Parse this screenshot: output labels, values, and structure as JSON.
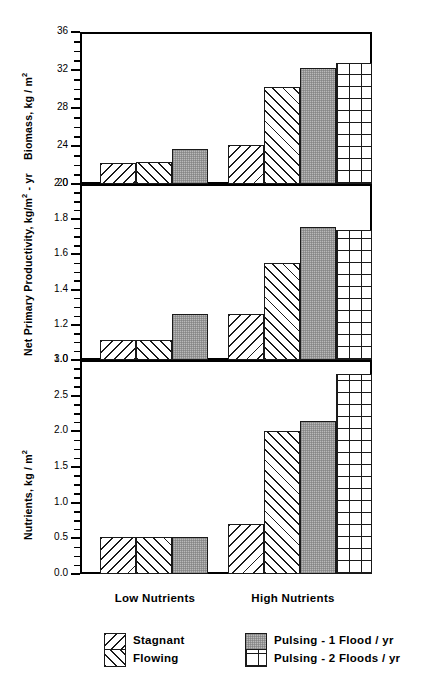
{
  "chart_data": {
    "type": "bar",
    "title": "",
    "layout": "three stacked panels sharing a common categorical x-axis",
    "categories": [
      "Low Nutrients",
      "High Nutrients"
    ],
    "legend_position": "below axis, two columns",
    "series": [
      {
        "name": "Stagnant",
        "pattern": "backslash-hatch",
        "values_by_panel": {
          "biomass": [
            22.2,
            24.1
          ],
          "npp": [
            1.115,
            1.26
          ],
          "nutrients": [
            0.52,
            0.7
          ]
        }
      },
      {
        "name": "Flowing",
        "pattern": "forwardslash-hatch",
        "values_by_panel": {
          "biomass": [
            22.3,
            30.2
          ],
          "npp": [
            1.115,
            1.55
          ],
          "nutrients": [
            0.52,
            2.0
          ]
        }
      },
      {
        "name": "Pulsing - 1 Flood / yr",
        "pattern": "gray-solid",
        "values_by_panel": {
          "biomass": [
            23.7,
            32.2
          ],
          "npp": [
            1.26,
            1.755
          ],
          "nutrients": [
            0.52,
            2.15
          ]
        }
      },
      {
        "name": "Pulsing - 2 Floods / yr",
        "pattern": "grid-crosshatch",
        "values_by_panel": {
          "biomass": [
            null,
            32.7
          ],
          "npp": [
            null,
            1.74
          ],
          "nutrients": [
            null,
            2.8
          ]
        }
      }
    ],
    "panels": [
      {
        "id": "biomass",
        "ylabel": "Biomass, kg / m",
        "ylabel_sup": "2",
        "ylim": [
          20,
          36
        ],
        "ytick_labels": [
          "20",
          "24",
          "28",
          "32",
          "36"
        ],
        "ytick_values": [
          20,
          24,
          28,
          32,
          36
        ],
        "minor_tick_step": 1,
        "grid": false,
        "bars": [
          {
            "group": "Low Nutrients",
            "series": "Stagnant",
            "value": 22.2
          },
          {
            "group": "Low Nutrients",
            "series": "Flowing",
            "value": 22.3
          },
          {
            "group": "Low Nutrients",
            "series": "Pulsing - 1 Flood / yr",
            "value": 23.7
          },
          {
            "group": "High Nutrients",
            "series": "Stagnant",
            "value": 24.1
          },
          {
            "group": "High Nutrients",
            "series": "Flowing",
            "value": 30.2
          },
          {
            "group": "High Nutrients",
            "series": "Pulsing - 1 Flood / yr",
            "value": 32.2
          },
          {
            "group": "High Nutrients",
            "series": "Pulsing - 2 Floods / yr",
            "value": 32.7
          }
        ]
      },
      {
        "id": "npp",
        "ylabel": "Net Primary Productivity, kg/m",
        "ylabel_sup": "2",
        "ylabel_tail": "- yr",
        "ylim": [
          1.0,
          2.0
        ],
        "ytick_labels": [
          "1.0",
          "1.2",
          "1.4",
          "1.6",
          "1.8",
          "2.0"
        ],
        "ytick_values": [
          1.0,
          1.2,
          1.4,
          1.6,
          1.8,
          2.0
        ],
        "minor_tick_step": 0.05,
        "grid": false,
        "bars": [
          {
            "group": "Low Nutrients",
            "series": "Stagnant",
            "value": 1.115
          },
          {
            "group": "Low Nutrients",
            "series": "Flowing",
            "value": 1.115
          },
          {
            "group": "Low Nutrients",
            "series": "Pulsing - 1 Flood / yr",
            "value": 1.26
          },
          {
            "group": "High Nutrients",
            "series": "Stagnant",
            "value": 1.26
          },
          {
            "group": "High Nutrients",
            "series": "Flowing",
            "value": 1.55
          },
          {
            "group": "High Nutrients",
            "series": "Pulsing - 1 Flood / yr",
            "value": 1.755
          },
          {
            "group": "High Nutrients",
            "series": "Pulsing - 2 Floods / yr",
            "value": 1.74
          }
        ]
      },
      {
        "id": "nutrients",
        "ylabel": "Nutrients, kg / m",
        "ylabel_sup": "2",
        "ylim": [
          0.0,
          3.0
        ],
        "ytick_labels": [
          "0.0",
          "0.5",
          "1.0",
          "1.5",
          "2.0",
          "2.5",
          "3.0"
        ],
        "ytick_values": [
          0.0,
          0.5,
          1.0,
          1.5,
          2.0,
          2.5,
          3.0
        ],
        "minor_tick_step": 0.125,
        "grid": false,
        "bars": [
          {
            "group": "Low Nutrients",
            "series": "Stagnant",
            "value": 0.52
          },
          {
            "group": "Low Nutrients",
            "series": "Flowing",
            "value": 0.52
          },
          {
            "group": "Low Nutrients",
            "series": "Pulsing - 1 Flood / yr",
            "value": 0.52
          },
          {
            "group": "High Nutrients",
            "series": "Stagnant",
            "value": 0.7
          },
          {
            "group": "High Nutrients",
            "series": "Flowing",
            "value": 2.0
          },
          {
            "group": "High Nutrients",
            "series": "Pulsing - 1 Flood / yr",
            "value": 2.15
          },
          {
            "group": "High Nutrients",
            "series": "Pulsing - 2 Floods / yr",
            "value": 2.8
          }
        ]
      }
    ]
  },
  "axis": {
    "category_labels": [
      "Low Nutrients",
      "High Nutrients"
    ]
  },
  "legend": {
    "left_column": [
      {
        "label": "Stagnant",
        "pattern": "backslash-hatch"
      },
      {
        "label": "Flowing",
        "pattern": "forwardslash-hatch"
      }
    ],
    "right_column": [
      {
        "label": "Pulsing - 1 Flood / yr",
        "pattern": "gray-solid"
      },
      {
        "label": "Pulsing - 2 Floods / yr",
        "pattern": "grid-crosshatch"
      }
    ]
  },
  "colors": {
    "axis": "#000000",
    "bar_outline": "#1a1a1a",
    "hatch": "#1a1a1a",
    "gray_fill": "#b9b9b9",
    "background": "#ffffff"
  }
}
